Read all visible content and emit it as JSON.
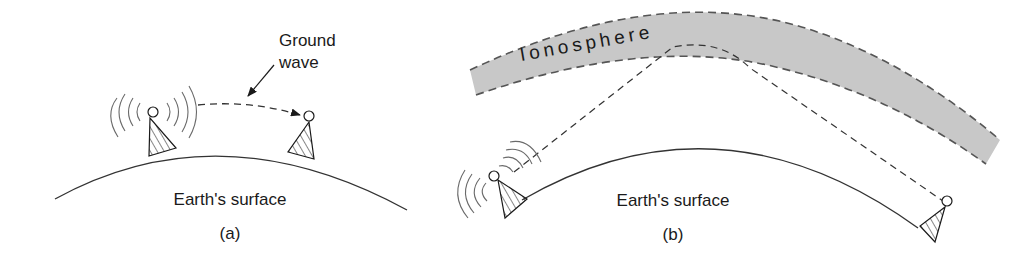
{
  "figure": {
    "panel_a": {
      "caption": "(a)",
      "surface_label": "Earth's surface",
      "wave_label_line1": "Ground",
      "wave_label_line2": "wave",
      "icons": [
        "transmitter-tower-icon",
        "receiver-tower-icon",
        "radio-waves-icon"
      ]
    },
    "panel_b": {
      "caption": "(b)",
      "surface_label": "Earth's surface",
      "layer_label": "Ionosphere",
      "icons": [
        "transmitter-tower-icon",
        "receiver-tower-icon",
        "radio-waves-icon"
      ]
    },
    "colors": {
      "ink": "#1a1a1a",
      "ionosphere_fill": "#c8c8c8",
      "dash": "#555555",
      "waves": "#6a6a6a"
    }
  }
}
